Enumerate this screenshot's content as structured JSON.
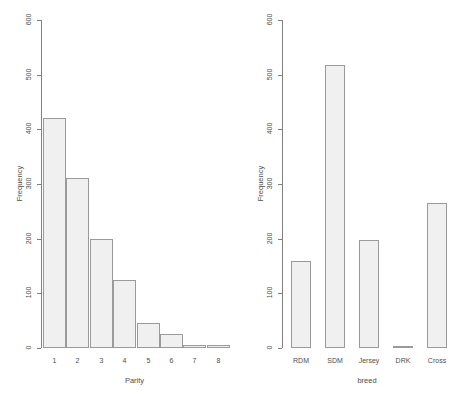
{
  "figure": {
    "background": "#ffffff",
    "bar_fill": "#f0f0f0",
    "bar_border": "#9a9a9a",
    "axis_color": "#808080",
    "text_color": "#4d4d4d"
  },
  "chart_data": [
    {
      "id": "parity",
      "type": "bar",
      "title": "",
      "xlabel": "Parity",
      "ylabel": "Frequency",
      "categories": [
        "1",
        "2",
        "3",
        "4",
        "5",
        "6",
        "7",
        "8"
      ],
      "values": [
        420,
        311,
        200,
        124,
        45,
        25,
        5,
        5
      ],
      "ylim": [
        0,
        600
      ],
      "yticks": [
        0,
        100,
        200,
        300,
        400,
        500,
        600
      ],
      "ytick_labels": [
        "0",
        "100",
        "200",
        "300",
        "400",
        "500",
        "600"
      ],
      "grid": false,
      "legend": "none",
      "bar_gap": 0
    },
    {
      "id": "breed",
      "type": "bar",
      "title": "",
      "xlabel": "breed",
      "ylabel": "Frequency",
      "categories": [
        "RDM",
        "SDM",
        "Jersey",
        "DRK",
        "Cross"
      ],
      "values": [
        160,
        517,
        197,
        3,
        266
      ],
      "ylim": [
        0,
        600
      ],
      "yticks": [
        0,
        100,
        200,
        300,
        400,
        500,
        600
      ],
      "ytick_labels": [
        "0",
        "100",
        "200",
        "300",
        "400",
        "500",
        "600"
      ],
      "grid": false,
      "legend": "none",
      "bar_gap": 14
    }
  ]
}
